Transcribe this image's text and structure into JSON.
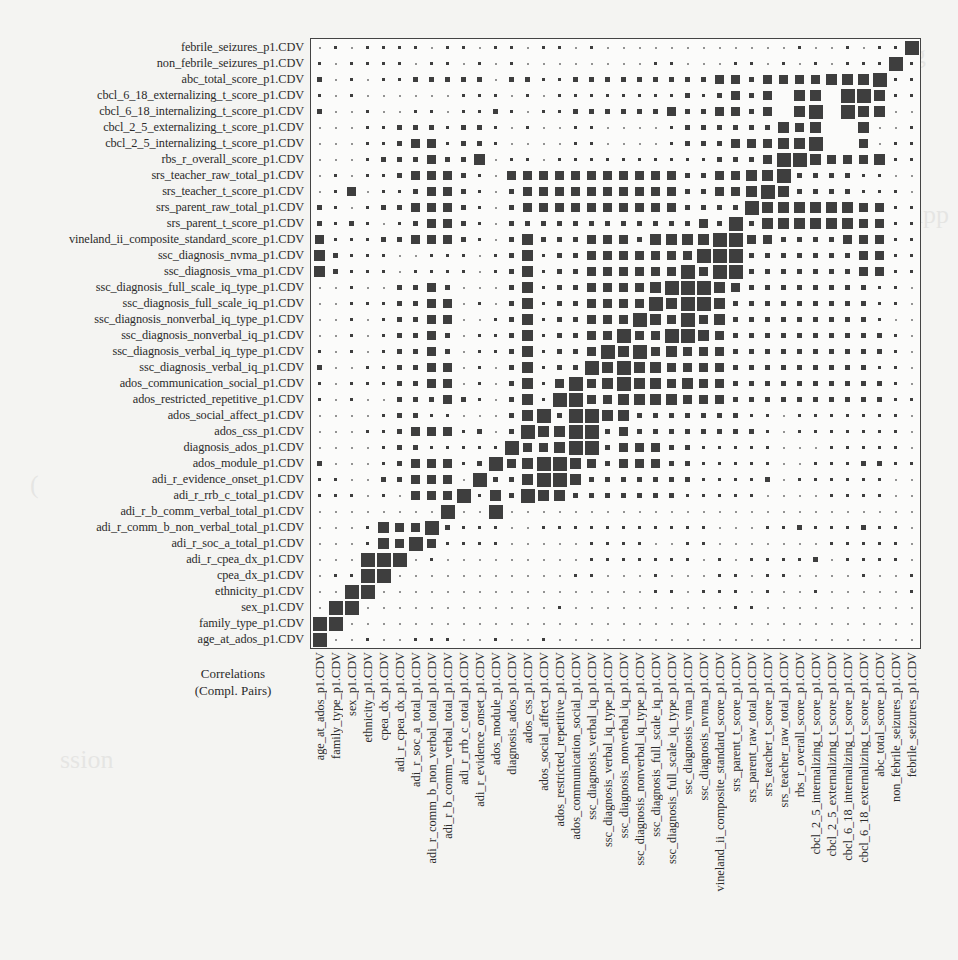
{
  "corner_label": {
    "line1": "Correlations",
    "line2": "(Compl. Pairs)"
  },
  "colors": {
    "square": "#3e3e3e",
    "frame": "#444444",
    "background": "#f4f4f2"
  },
  "chart_data": {
    "type": "heatmap",
    "title": "Correlations (Compl. Pairs)",
    "subtitle": "",
    "xlabel": "",
    "ylabel": "",
    "encoding": "square size proportional to |correlation|; levels 0 (tiny) to 5 (diagonal = 1.0); x = no complete pairs (blank)",
    "legend": "none",
    "grid": false,
    "variables": [
      "age_at_ados_p1.CDV",
      "family_type_p1.CDV",
      "sex_p1.CDV",
      "ethnicity_p1.CDV",
      "cpea_dx_p1.CDV",
      "adi_r_cpea_dx_p1.CDV",
      "adi_r_soc_a_total_p1.CDV",
      "adi_r_comm_b_non_verbal_total_p1.CDV",
      "adi_r_b_comm_verbal_total_p1.CDV",
      "adi_r_rrb_c_total_p1.CDV",
      "adi_r_evidence_onset_p1.CDV",
      "ados_module_p1.CDV",
      "diagnosis_ados_p1.CDV",
      "ados_css_p1.CDV",
      "ados_social_affect_p1.CDV",
      "ados_restricted_repetitive_p1.CDV",
      "ados_communication_social_p1.CDV",
      "ssc_diagnosis_verbal_iq_p1.CDV",
      "ssc_diagnosis_verbal_iq_type_p1.CDV",
      "ssc_diagnosis_nonverbal_iq_p1.CDV",
      "ssc_diagnosis_nonverbal_iq_type_p1.CDV",
      "ssc_diagnosis_full_scale_iq_p1.CDV",
      "ssc_diagnosis_full_scale_iq_type_p1.CDV",
      "ssc_diagnosis_vma_p1.CDV",
      "ssc_diagnosis_nvma_p1.CDV",
      "vineland_ii_composite_standard_score_p1.CDV",
      "srs_parent_t_score_p1.CDV",
      "srs_parent_raw_total_p1.CDV",
      "srs_teacher_t_score_p1.CDV",
      "srs_teacher_raw_total_p1.CDV",
      "rbs_r_overall_score_p1.CDV",
      "cbcl_2_5_internalizing_t_score_p1.CDV",
      "cbcl_2_5_externalizing_t_score_p1.CDV",
      "cbcl_6_18_internalizing_t_score_p1.CDV",
      "cbcl_6_18_externalizing_t_score_p1.CDV",
      "abc_total_score_p1.CDV",
      "non_febrile_seizures_p1.CDV",
      "febrile_seizures_p1.CDV"
    ],
    "row_order": "top-to-bottom = variables reversed (febrile_seizures first)",
    "col_order": "left-to-right = variables in order (age_at_ados first)",
    "rows": [
      "01011110110110110100000000000010010115",
      "10111101101010000000011000110101011151",
      "20101122222022112222222223323333444411",
      "10100000011101011111111212323x44x54411",
      "20010011011210112222223223323x45x34400",
      "00011222122101001100001222222434xx4001",
      "00011233122100001100001222333443xx3011",
      "00012223224011011111111112223544333411",
      "01011233321033333333333223344422221100",
      "01301123321023333333333223344422221110",
      "21012233321023333333333222244444443311",
      "21210123321022222222222232224444443311",
      "31112233321024222333244445533222233311",
      "42111001110124122333333335522222223311",
      "42111011110124122333333335522222223311",
      "00100223200024122333344554322222222110",
      "00111223301024122333334554222222222110",
      "00101223300124122333343534222222222100",
      "00101223201124122333335543222222222210",
      "10101223201124122334534333222222222210",
      "20011223301024122345443333222222222110",
      "10111223301024133345443433222222222210",
      "10100222321024155334444333222222222211",
      "00001221100024225544222222211011111110",
      "00011233312024445523222222221011111110",
      "00001221111123345523332211111000111110",
      "20001233312034554323332211111001112211",
      "11002233301224554222222211112011111100",
      "11101033311425442222222111110000111100",
      "00000000000500000000000000000000000000",
      "00014333211100111111111110001121112110",
      "00014333111100000111100110000000111110",
      "00055001000000000111111101011112011110",
      "01150000000000001100010001101100001001",
      "00510000000000000000011011101001000001",
      "05100000000000010000000000110000000000",
      "51000000000000000000000000000000000000",
      "50010011100100100000000000000000000000"
    ]
  }
}
